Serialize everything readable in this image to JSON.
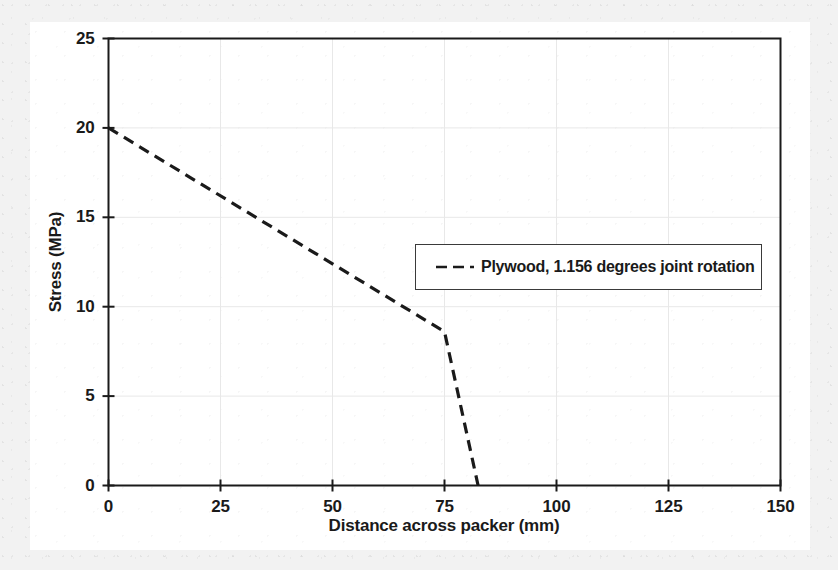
{
  "figure": {
    "background_color": "#f2f2f2",
    "card_color": "#ffffff",
    "axis_color": "#1a1a1a",
    "grid_color": "#e8e8e8",
    "series_color": "#1a1a1a"
  },
  "chart_data": {
    "type": "line",
    "title": "",
    "xlabel": "Distance across packer (mm)",
    "ylabel": "Stress (MPa)",
    "xlim": [
      0,
      150
    ],
    "ylim": [
      0,
      25
    ],
    "xticks": [
      0,
      25,
      50,
      75,
      100,
      125,
      150
    ],
    "yticks": [
      0,
      5,
      10,
      15,
      20,
      25
    ],
    "xtick_labels": [
      "0",
      "25",
      "50",
      "75",
      "100",
      "125",
      "150"
    ],
    "ytick_labels": [
      "0",
      "5",
      "10",
      "15",
      "20",
      "25"
    ],
    "grid": true,
    "legend_position": "center-right",
    "series": [
      {
        "name": "Plywood, 1.156 degrees joint rotation",
        "style": "dashed",
        "color": "#1a1a1a",
        "x": [
          0,
          75,
          82.5
        ],
        "y": [
          20,
          8.6,
          0
        ]
      }
    ]
  },
  "legend": {
    "entries": [
      {
        "label": "Plywood, 1.156 degrees joint rotation",
        "marker": "dashed-line-marker"
      }
    ]
  }
}
